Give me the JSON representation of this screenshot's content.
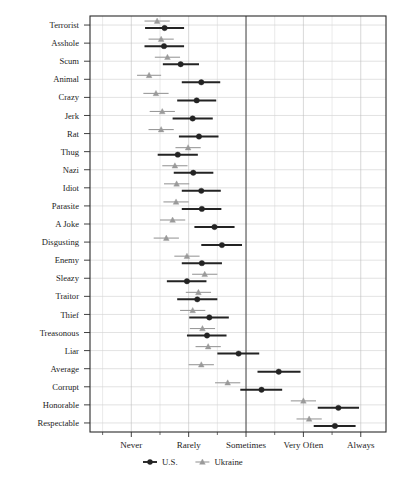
{
  "chart_data": {
    "type": "scatter",
    "title": "",
    "xlabel": "",
    "ylabel": "",
    "grid": true,
    "legend_position": "bottom",
    "xtick_labels": [
      "Never",
      "Rarely",
      "Sometimes",
      "Very Often",
      "Always"
    ],
    "xtick_values": [
      1,
      2,
      3,
      4,
      5
    ],
    "xlim": [
      0.28,
      5.44
    ],
    "categories": [
      "Terrorist",
      "Asshole",
      "Scum",
      "Animal",
      "Crazy",
      "Jerk",
      "Rat",
      "Thug",
      "Nazi",
      "Idiot",
      "Parasite",
      "A Joke",
      "Disgusting",
      "Enemy",
      "Sleazy",
      "Traitor",
      "Thief",
      "Treasonous",
      "Liar",
      "Average",
      "Corrupt",
      "Honorable",
      "Respectable"
    ],
    "series": [
      {
        "name": "U.S.",
        "marker": "circle",
        "color": "#232323",
        "values": [
          1.58,
          1.57,
          1.86,
          2.22,
          2.14,
          2.07,
          2.18,
          1.81,
          2.08,
          2.22,
          2.23,
          2.45,
          2.58,
          2.23,
          1.97,
          2.15,
          2.36,
          2.32,
          2.87,
          3.57,
          3.27,
          4.61,
          4.55
        ],
        "ci_low": [
          1.24,
          1.23,
          1.55,
          1.88,
          1.8,
          1.72,
          1.83,
          1.46,
          1.74,
          1.88,
          1.88,
          2.1,
          2.22,
          1.88,
          1.62,
          1.8,
          2.01,
          1.97,
          2.5,
          3.2,
          2.9,
          4.25,
          4.18
        ],
        "ci_high": [
          1.92,
          1.92,
          2.18,
          2.55,
          2.48,
          2.42,
          2.52,
          2.16,
          2.43,
          2.56,
          2.57,
          2.8,
          2.93,
          2.58,
          2.31,
          2.5,
          2.7,
          2.66,
          3.23,
          3.95,
          3.63,
          4.97,
          4.91
        ]
      },
      {
        "name": "Ukraine",
        "marker": "triangle",
        "color": "#9a9a9a",
        "values": [
          1.45,
          1.52,
          1.63,
          1.31,
          1.43,
          1.54,
          1.52,
          1.99,
          1.76,
          1.79,
          1.78,
          1.72,
          1.61,
          1.97,
          2.28,
          2.17,
          2.07,
          2.24,
          2.34,
          2.22,
          2.68,
          4.0,
          4.1
        ],
        "ci_low": [
          1.23,
          1.3,
          1.41,
          1.1,
          1.21,
          1.32,
          1.3,
          1.77,
          1.54,
          1.57,
          1.56,
          1.5,
          1.39,
          1.75,
          2.06,
          1.95,
          1.85,
          2.02,
          2.12,
          2.0,
          2.46,
          3.78,
          3.88
        ],
        "ci_high": [
          1.67,
          1.74,
          1.85,
          1.52,
          1.65,
          1.76,
          1.74,
          2.21,
          1.98,
          2.01,
          2.0,
          1.94,
          1.83,
          2.19,
          2.5,
          2.39,
          2.29,
          2.46,
          2.56,
          2.44,
          2.9,
          4.22,
          4.32
        ]
      }
    ],
    "legend": [
      {
        "label": "U.S.",
        "marker": "circle",
        "color": "#232323"
      },
      {
        "label": "Ukraine",
        "marker": "triangle",
        "color": "#9a9a9a"
      }
    ]
  }
}
